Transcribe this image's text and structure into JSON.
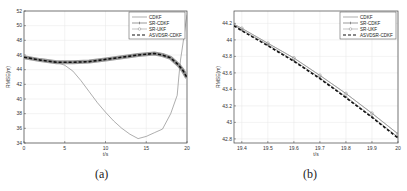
{
  "chart_data": [
    {
      "panel": "(a)",
      "type": "line",
      "xlabel": "t/s",
      "ylabel": "RMSE(m)",
      "xlim": [
        0,
        20
      ],
      "ylim": [
        34,
        52
      ],
      "xticks": [
        0,
        5,
        10,
        15,
        20
      ],
      "yticks": [
        34,
        36,
        38,
        40,
        42,
        44,
        46,
        48,
        50,
        52
      ],
      "grid": true,
      "legend_position": "upper right",
      "series": [
        {
          "name": "CDKF",
          "style": "solid thin",
          "x": [
            0,
            2,
            4,
            5,
            6,
            7,
            8,
            9,
            10,
            11,
            12,
            13,
            14,
            15,
            16,
            17,
            18,
            18.8,
            19,
            19.2,
            19.5,
            19.8,
            20
          ],
          "y": [
            45.7,
            45.3,
            45.0,
            44.6,
            43.8,
            42.5,
            41.0,
            39.5,
            38.2,
            37.0,
            36.0,
            35.2,
            34.6,
            34.9,
            35.4,
            35.9,
            38.0,
            40.5,
            43.0,
            45.3,
            47.5,
            50.0,
            51.5
          ]
        },
        {
          "name": "SR-CDKF",
          "style": "solid with + markers",
          "x": [
            0,
            2,
            4,
            6,
            8,
            10,
            12,
            14,
            15,
            16,
            17,
            18,
            19,
            19.5,
            20
          ],
          "y": [
            45.7,
            45.3,
            45.0,
            45.0,
            45.1,
            45.4,
            45.7,
            46.0,
            46.1,
            46.2,
            46.0,
            45.6,
            44.6,
            43.9,
            42.9
          ]
        },
        {
          "name": "SR-UKF",
          "style": "solid with o markers",
          "x": [
            0,
            2,
            4,
            6,
            8,
            10,
            12,
            14,
            15,
            16,
            17,
            18,
            19,
            19.5,
            20
          ],
          "y": [
            45.7,
            45.3,
            45.0,
            45.0,
            45.1,
            45.4,
            45.7,
            46.0,
            46.1,
            46.2,
            46.0,
            45.6,
            44.6,
            43.9,
            42.9
          ]
        },
        {
          "name": "ASVDSR-CDKF",
          "style": "dashed thick",
          "x": [
            0,
            2,
            4,
            6,
            8,
            10,
            12,
            14,
            15,
            16,
            17,
            18,
            19,
            19.5,
            20
          ],
          "y": [
            45.7,
            45.3,
            45.0,
            45.0,
            45.1,
            45.4,
            45.7,
            46.0,
            46.1,
            46.2,
            46.0,
            45.6,
            44.6,
            43.9,
            42.9
          ]
        }
      ]
    },
    {
      "panel": "(b)",
      "type": "line",
      "xlabel": "t/s",
      "ylabel": "RMSE(m)",
      "xlim": [
        19.37,
        20
      ],
      "ylim": [
        42.75,
        44.35
      ],
      "xticks": [
        19.4,
        19.5,
        19.6,
        19.7,
        19.8,
        19.9,
        20
      ],
      "yticks": [
        42.8,
        43,
        43.2,
        43.4,
        43.6,
        43.8,
        44,
        44.2
      ],
      "grid": true,
      "legend_position": "upper right",
      "series": [
        {
          "name": "CDKF",
          "style": "solid thin",
          "x": [
            19.37,
            19.4,
            19.5,
            19.6,
            19.7,
            19.8,
            19.9,
            20
          ],
          "y": [
            44.19,
            44.14,
            43.96,
            43.78,
            43.57,
            43.35,
            43.11,
            42.86
          ]
        },
        {
          "name": "SR-CDKF",
          "style": "solid with + markers",
          "x": [
            19.37,
            19.4,
            19.5,
            19.6,
            19.7,
            19.8,
            19.9,
            20
          ],
          "y": [
            44.18,
            44.12,
            43.94,
            43.75,
            43.54,
            43.31,
            43.07,
            42.82
          ]
        },
        {
          "name": "SR-UKF",
          "style": "solid with o markers",
          "x": [
            19.37,
            19.4,
            19.5,
            19.6,
            19.7,
            19.8,
            19.9,
            20
          ],
          "y": [
            44.19,
            44.14,
            43.96,
            43.78,
            43.57,
            43.35,
            43.11,
            42.86
          ]
        },
        {
          "name": "ASVDSR-CDKF",
          "style": "dashed thick",
          "x": [
            19.37,
            19.4,
            19.5,
            19.6,
            19.7,
            19.8,
            19.9,
            20
          ],
          "y": [
            44.17,
            44.11,
            43.93,
            43.74,
            43.53,
            43.3,
            43.06,
            42.81
          ]
        }
      ]
    }
  ],
  "captions": {
    "a": "(a)",
    "b": "(b)"
  },
  "legend": {
    "items": [
      "CDKF",
      "SR-CDKF",
      "SR-UKF",
      "ASVDSR-CDKF"
    ]
  },
  "axes": {
    "xlabel": "t/s",
    "ylabel": "RMSE(m)"
  }
}
